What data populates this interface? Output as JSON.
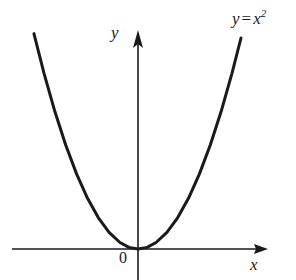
{
  "figure": {
    "background_color": "#ffffff",
    "ink_color": "#1a1a1a",
    "width": 296,
    "height": 280
  },
  "labels": {
    "curve_variable": "y",
    "curve_equals": "=",
    "curve_base": "x",
    "curve_exponent": "2",
    "curve_full": "y = x2",
    "y_axis": "y",
    "x_axis": "x",
    "origin": "0"
  },
  "chart_data": {
    "type": "line",
    "title": "",
    "subtitle": "",
    "xlabel": "x",
    "ylabel": "y",
    "annotations": [
      {
        "text": "y = x^2",
        "x": 3.1,
        "y": 9.6
      },
      {
        "text": "0",
        "x": -0.25,
        "y": -0.55
      }
    ],
    "legend": [],
    "legend_position": "none",
    "grid": false,
    "axes": {
      "x_axis_visible": true,
      "y_axis_visible": true,
      "x_arrow": true,
      "y_arrow": true,
      "origin_marked": true
    },
    "xlim": [
      -3.6,
      3.6
    ],
    "ylim": [
      -0.9,
      10.5
    ],
    "xticks": [],
    "yticks": [],
    "series": [
      {
        "name": "y = x^2",
        "equation": "y = x^2",
        "color": "#1a1a1a",
        "line_width": 3,
        "x": [
          -2.88,
          -2.6,
          -2.3,
          -2.0,
          -1.7,
          -1.4,
          -1.1,
          -0.8,
          -0.5,
          -0.25,
          0.0,
          0.25,
          0.5,
          0.8,
          1.1,
          1.4,
          1.7,
          2.0,
          2.3,
          2.6,
          2.85
        ],
        "y": [
          8.29,
          6.76,
          5.29,
          4.0,
          2.89,
          1.96,
          1.21,
          0.64,
          0.25,
          0.0625,
          0.0,
          0.0625,
          0.25,
          0.64,
          1.21,
          1.96,
          2.89,
          4.0,
          5.29,
          6.76,
          8.12
        ]
      }
    ]
  },
  "geometry": {
    "origin_px": {
      "x": 138,
      "y": 249
    },
    "x_axis_px": {
      "x1": 12,
      "y1": 249,
      "x2": 268,
      "y2": 249
    },
    "y_axis_px": {
      "x1": 138,
      "y1": 38,
      "x2": 138,
      "y2": 280
    },
    "curve_left_end_px": {
      "x": 32,
      "y": 42
    },
    "curve_right_end_px": {
      "x": 241,
      "y": 38
    },
    "curve_vertex_px": {
      "x": 138,
      "y": 248
    }
  }
}
